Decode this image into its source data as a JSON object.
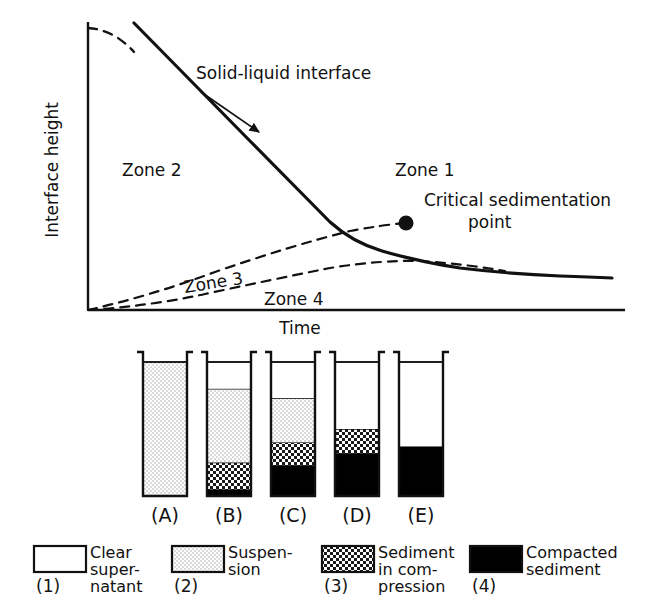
{
  "figure": {
    "type": "sedimentation-zone-diagram",
    "background_color": "#ffffff",
    "ink_color": "#111111"
  },
  "chart_data": {
    "type": "line",
    "title": "",
    "xlabel": "Time",
    "ylabel": "Interface height",
    "grid": false,
    "legend_position": "bottom",
    "axis": {
      "x_origin_px": 88,
      "y_origin_px": 310,
      "x_end_px": 625,
      "y_top_px": 22,
      "tick_labels_x": [],
      "tick_labels_y": []
    },
    "annotations": [
      {
        "name": "solid-liquid-interface",
        "text": "Solid-liquid interface",
        "x_px": 196,
        "y_px": 75,
        "arrow_from": [
          200,
          88
        ],
        "arrow_to": [
          258,
          130
        ]
      },
      {
        "name": "critical-sedimentation-point",
        "text": "Critical sedimentation point",
        "marker": "filled-circle",
        "marker_x_px": 406,
        "marker_y_px": 223,
        "label_x_px": 424,
        "label_y_px": 206
      },
      {
        "name": "zone-1-label",
        "text": "Zone 1",
        "x_px": 395,
        "y_px": 170
      },
      {
        "name": "zone-2-label",
        "text": "Zone 2",
        "x_px": 122,
        "y_px": 170
      },
      {
        "name": "zone-3-label",
        "text": "Zone 3",
        "x_px": 185,
        "y_px": 285
      },
      {
        "name": "zone-4-label",
        "text": "Zone 4",
        "x_px": 264,
        "y_px": 299
      }
    ],
    "series": [
      {
        "name": "Solid-liquid interface",
        "style": "solid-with-dashed-ends",
        "description": "Upper interface: falls from initial height, linear through zone 1, bends at critical sedimentation point, flattens to final compacted level",
        "points": [
          [
            88,
            28
          ],
          [
            100,
            30
          ],
          [
            112,
            36
          ],
          [
            124,
            45
          ],
          [
            136,
            57
          ],
          [
            160,
            81
          ],
          [
            190,
            111
          ],
          [
            220,
            141
          ],
          [
            250,
            170
          ],
          [
            280,
            196
          ],
          [
            320,
            210
          ],
          [
            340,
            196
          ],
          [
            360,
            205
          ],
          [
            380,
            214
          ],
          [
            406,
            223
          ],
          [
            430,
            243
          ],
          [
            455,
            258
          ],
          [
            480,
            267
          ],
          [
            510,
            272
          ],
          [
            545,
            275
          ],
          [
            580,
            277
          ],
          [
            610,
            278
          ]
        ],
        "dashed_head_until_x": 134,
        "dashed_tail_from_x": null
      },
      {
        "name": "Zone 3 boundary",
        "style": "dashed",
        "description": "Rising boundary between suspension and sediment in compression; meets interface curve at critical sedimentation point",
        "points": [
          [
            88,
            310
          ],
          [
            110,
            303
          ],
          [
            140,
            294
          ],
          [
            175,
            283
          ],
          [
            210,
            272
          ],
          [
            250,
            259
          ],
          [
            290,
            247
          ],
          [
            330,
            236
          ],
          [
            370,
            228
          ],
          [
            406,
            223
          ]
        ]
      },
      {
        "name": "Zone 4 boundary",
        "style": "dashed",
        "description": "Rising boundary of compacted sediment; peaks then slowly merges with the final interface level",
        "points": [
          [
            88,
            310
          ],
          [
            120,
            307
          ],
          [
            155,
            303
          ],
          [
            190,
            297
          ],
          [
            230,
            288
          ],
          [
            270,
            279
          ],
          [
            310,
            271
          ],
          [
            350,
            265
          ],
          [
            390,
            262
          ],
          [
            430,
            262
          ],
          [
            470,
            265
          ],
          [
            505,
            270
          ]
        ]
      }
    ],
    "zones": [
      {
        "id": 1,
        "label": "Zone 1",
        "meaning": "suspension above descending interface"
      },
      {
        "id": 2,
        "label": "Zone 2",
        "meaning": "clear supernatant region"
      },
      {
        "id": 3,
        "label": "Zone 3",
        "meaning": "sediment in compression"
      },
      {
        "id": 4,
        "label": "Zone 4",
        "meaning": "compacted sediment"
      }
    ]
  },
  "cylinders": {
    "caption_format": "(X)",
    "items": [
      {
        "id": "A",
        "caption": "(A)",
        "x_px": 143,
        "width_px": 44,
        "layers": [
          {
            "type": "clear",
            "fraction": 0.0
          },
          {
            "type": "suspension",
            "fraction": 1.0
          },
          {
            "type": "compression",
            "fraction": 0.0
          },
          {
            "type": "compacted",
            "fraction": 0.0
          }
        ]
      },
      {
        "id": "B",
        "caption": "(B)",
        "x_px": 207,
        "width_px": 44,
        "layers": [
          {
            "type": "clear",
            "fraction": 0.2
          },
          {
            "type": "suspension",
            "fraction": 0.55
          },
          {
            "type": "compression",
            "fraction": 0.2
          },
          {
            "type": "compacted",
            "fraction": 0.05
          }
        ]
      },
      {
        "id": "C",
        "caption": "(C)",
        "x_px": 271,
        "width_px": 44,
        "layers": [
          {
            "type": "clear",
            "fraction": 0.27
          },
          {
            "type": "suspension",
            "fraction": 0.33
          },
          {
            "type": "compression",
            "fraction": 0.17
          },
          {
            "type": "compacted",
            "fraction": 0.23
          }
        ]
      },
      {
        "id": "D",
        "caption": "(D)",
        "x_px": 335,
        "width_px": 44,
        "layers": [
          {
            "type": "clear",
            "fraction": 0.5
          },
          {
            "type": "suspension",
            "fraction": 0.0
          },
          {
            "type": "compression",
            "fraction": 0.18
          },
          {
            "type": "compacted",
            "fraction": 0.32
          }
        ]
      },
      {
        "id": "E",
        "caption": "(E)",
        "x_px": 399,
        "width_px": 44,
        "layers": [
          {
            "type": "clear",
            "fraction": 0.63
          },
          {
            "type": "suspension",
            "fraction": 0.0
          },
          {
            "type": "compression",
            "fraction": 0.0
          },
          {
            "type": "compacted",
            "fraction": 0.37
          }
        ]
      }
    ]
  },
  "legend": {
    "items": [
      {
        "number": "(1)",
        "swatch": "clear",
        "lines": [
          "Clear",
          "super-",
          "natant"
        ]
      },
      {
        "number": "(2)",
        "swatch": "suspension",
        "lines": [
          "Suspen-",
          "sion"
        ]
      },
      {
        "number": "(3)",
        "swatch": "compression",
        "lines": [
          "Sediment",
          "in com-",
          "pression"
        ]
      },
      {
        "number": "(4)",
        "swatch": "compacted",
        "lines": [
          "Compacted",
          "sediment"
        ]
      }
    ]
  }
}
